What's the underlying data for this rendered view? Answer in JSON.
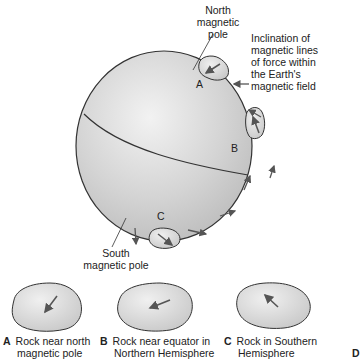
{
  "labels": {
    "north_pole": [
      "North",
      "magnetic",
      "pole"
    ],
    "inclination": [
      "Inclination of",
      "magnetic lines",
      "of force within",
      "the Earth's",
      "magnetic field"
    ],
    "south_pole": [
      "South",
      "magnetic pole"
    ],
    "point_a": "A",
    "point_b": "B",
    "point_c": "C"
  },
  "captions": [
    {
      "letter": "A",
      "line1": "Rock near north",
      "line2": "magnetic pole"
    },
    {
      "letter": "B",
      "line1": "Rock near equator in",
      "line2": "Northern Hemisphere"
    },
    {
      "letter": "C",
      "line1": "Rock in Southern",
      "line2": "Hemisphere"
    }
  ],
  "edge_letter": "D",
  "colors": {
    "globe_fill": "#d6d6d6",
    "rock_fill": "#d9d9d9",
    "outline": "#333333",
    "arrow": "#555555"
  }
}
